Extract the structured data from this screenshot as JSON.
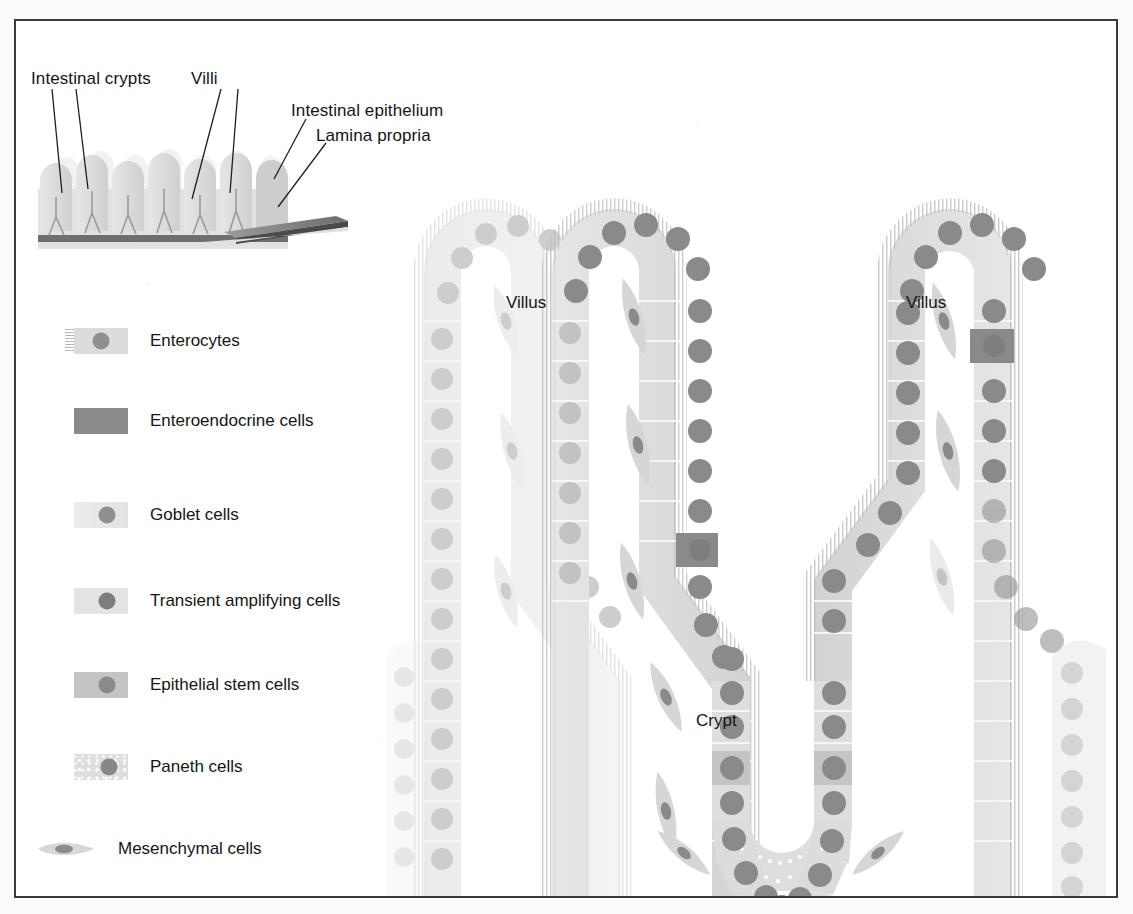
{
  "figure": {
    "type": "biological-diagram"
  },
  "inset": {
    "name": "intestinal-mucosa-schematic",
    "labels": [
      {
        "id": "intestinal-crypts",
        "text": "Intestinal crypts"
      },
      {
        "id": "villi",
        "text": "Villi"
      },
      {
        "id": "intestinal-epithelium",
        "text": "Intestinal epithelium"
      },
      {
        "id": "lamina-propria",
        "text": "Lamina propria"
      }
    ]
  },
  "legend": {
    "title": "",
    "items": [
      {
        "id": "enterocytes",
        "label": "Enterocytes",
        "swatch": "cell-with-microvilli",
        "body_color": "#dcdcdc",
        "nucleus_color": "#8f8f8f"
      },
      {
        "id": "enteroendocrine",
        "label": "Enteroendocrine cells",
        "swatch": "solid-block",
        "body_color": "#8a8a8a",
        "nucleus_color": "#8a8a8a"
      },
      {
        "id": "goblet",
        "label": "Goblet cells",
        "swatch": "cell-plain-light",
        "body_color": "#e4e4e4",
        "nucleus_color": "#8f8f8f"
      },
      {
        "id": "transient-amplifying",
        "label": "Transient amplifying cells",
        "swatch": "cell-plain-light",
        "body_color": "#e2e2e2",
        "nucleus_color": "#7d7d7d"
      },
      {
        "id": "epithelial-stem",
        "label": "Epithelial stem cells",
        "swatch": "cell-plain-mid",
        "body_color": "#c4c4c4",
        "nucleus_color": "#8a8a8a"
      },
      {
        "id": "paneth",
        "label": "Paneth cells",
        "swatch": "cell-stippled",
        "body_color": "#dedede",
        "nucleus_color": "#878787"
      },
      {
        "id": "mesenchymal",
        "label": "Mesenchymal cells",
        "swatch": "spindle",
        "body_color": "#d8d8d8",
        "nucleus_color": "#8a8a8a"
      }
    ]
  },
  "diagram": {
    "labels": [
      {
        "id": "villus-left",
        "text": "Villus"
      },
      {
        "id": "crypt",
        "text": "Crypt"
      },
      {
        "id": "villus-right",
        "text": "Villus"
      }
    ],
    "structures": [
      {
        "id": "villus-left-structure",
        "kind": "villus"
      },
      {
        "id": "crypt-structure",
        "kind": "crypt"
      },
      {
        "id": "villus-right-structure",
        "kind": "villus"
      }
    ],
    "enteroendocrine_markers": 2
  },
  "colors": {
    "border": "#3a3a3a",
    "background": "#ffffff",
    "epithelium_light": "#dcdcdc",
    "epithelium_mid": "#c6c6c6",
    "nucleus": "#8a8a8a",
    "nucleus_dark": "#787878",
    "enteroendocrine": "#8a8a8a",
    "microvilli": "#bdbdbd",
    "mesenchyme": "#d6d6d6",
    "text": "#151515"
  }
}
